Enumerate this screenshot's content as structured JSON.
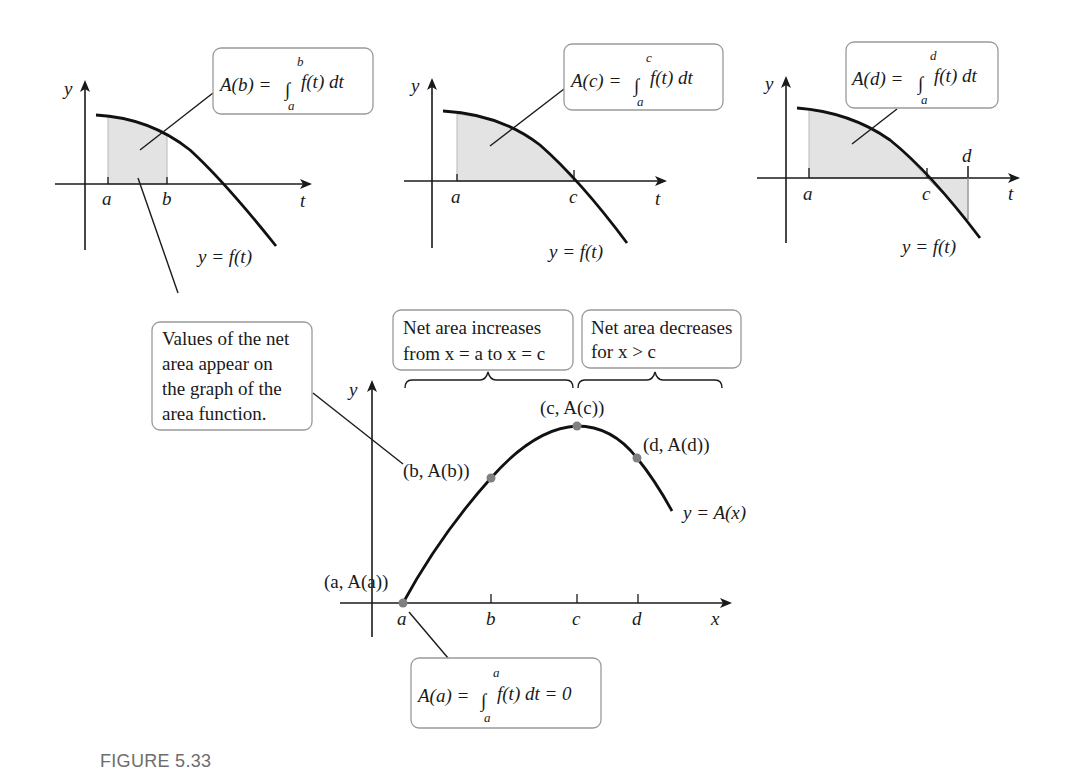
{
  "figure": {
    "caption": "FIGURE 5.33"
  },
  "panels": [
    {
      "id": "panel-b",
      "y_label": "y",
      "x_label": "t",
      "ticks": [
        "a",
        "b"
      ],
      "curve_label": "y = f(t)",
      "callout": {
        "lhs": "A(b) = ",
        "upper": "b",
        "lower": "a",
        "integrand": "f(t) dt"
      }
    },
    {
      "id": "panel-c",
      "y_label": "y",
      "x_label": "t",
      "ticks": [
        "a",
        "c"
      ],
      "curve_label": "y = f(t)",
      "callout": {
        "lhs": "A(c) = ",
        "upper": "c",
        "lower": "a",
        "integrand": "f(t) dt"
      }
    },
    {
      "id": "panel-d",
      "y_label": "y",
      "x_label": "t",
      "ticks": [
        "a",
        "c",
        "d"
      ],
      "curve_label": "y = f(t)",
      "callout": {
        "lhs": "A(d) = ",
        "upper": "d",
        "lower": "a",
        "integrand": "f(t) dt"
      }
    }
  ],
  "area_graph": {
    "y_label": "y",
    "x_label": "x",
    "ticks": [
      "a",
      "b",
      "c",
      "d"
    ],
    "curve_label": "y = A(x)",
    "points": [
      {
        "label": "(a, A(a))"
      },
      {
        "label": "(b, A(b))"
      },
      {
        "label": "(c, A(c))"
      },
      {
        "label": "(d, A(d))"
      }
    ],
    "note_box": {
      "lines": [
        "Values of the net",
        "area appear on",
        "the graph of the",
        "area function."
      ]
    },
    "increase_box": {
      "lines": [
        "Net area increases",
        "from x = a to x = c"
      ]
    },
    "decrease_box": {
      "lines": [
        "Net area decreases",
        "for x > c"
      ]
    },
    "bottom_callout": {
      "lhs": "A(a) = ",
      "upper": "a",
      "lower": "a",
      "integrand": "f(t) dt = 0"
    }
  }
}
